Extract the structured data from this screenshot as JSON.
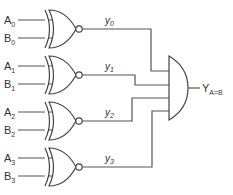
{
  "diagram": {
    "line_color": "#555555",
    "background": "#ffffff",
    "gates": [
      {
        "type": "XNOR",
        "input_a": {
          "base": "A",
          "sub": "0"
        },
        "input_b": {
          "base": "B",
          "sub": "0"
        },
        "output": {
          "base": "y",
          "sub": "0"
        }
      },
      {
        "type": "XNOR",
        "input_a": {
          "base": "A",
          "sub": "1"
        },
        "input_b": {
          "base": "B",
          "sub": "1"
        },
        "output": {
          "base": "y",
          "sub": "1"
        }
      },
      {
        "type": "XNOR",
        "input_a": {
          "base": "A",
          "sub": "2"
        },
        "input_b": {
          "base": "B",
          "sub": "2"
        },
        "output": {
          "base": "y",
          "sub": "2"
        }
      },
      {
        "type": "XNOR",
        "input_a": {
          "base": "A",
          "sub": "3"
        },
        "input_b": {
          "base": "B",
          "sub": "3"
        },
        "output": {
          "base": "y",
          "sub": "3"
        }
      }
    ],
    "and_gate": {
      "type": "AND",
      "inputs": 4
    },
    "final_output": {
      "base": "Y",
      "sub": "A=B"
    }
  }
}
